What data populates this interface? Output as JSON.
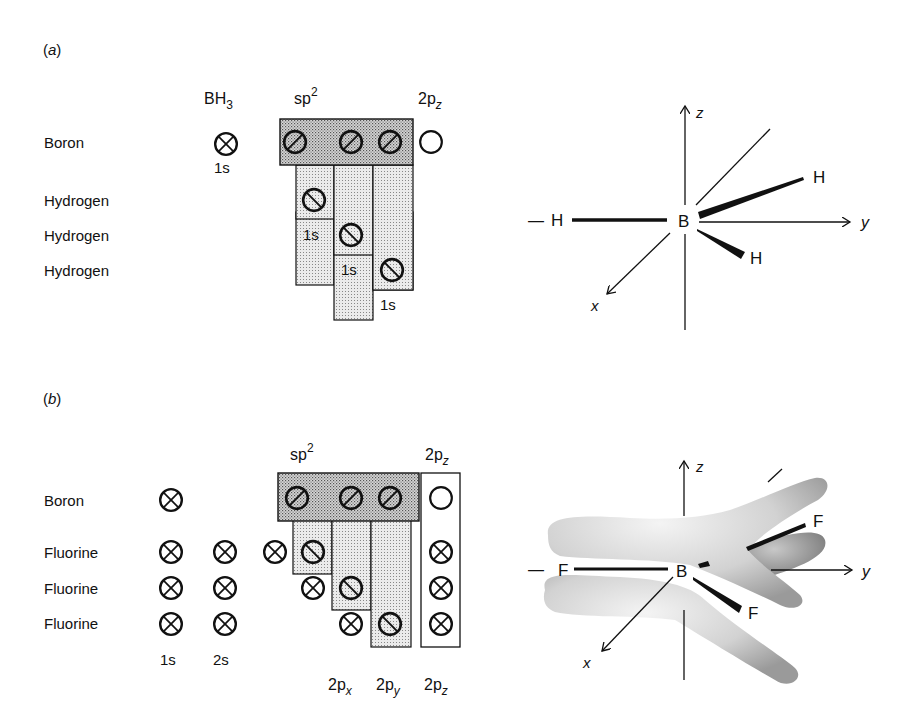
{
  "panel_a": {
    "label": "(a)",
    "headers": {
      "bh3": "BH",
      "bh3_sub": "3",
      "sp2": "sp",
      "sp2_sup": "2",
      "p2z": "2p",
      "p2z_sub": "z"
    },
    "rows": [
      "Boron",
      "Hydrogen",
      "Hydrogen",
      "Hydrogen"
    ],
    "orbital_labels": {
      "boron_1s": "1s",
      "h1": "1s",
      "h2": "1s",
      "h3": "1s"
    },
    "molecule": {
      "atoms": {
        "center": "B",
        "left": "H",
        "upper_right": "H",
        "lower_right": "H",
        "far_left_dash": "—"
      },
      "axes": {
        "x": "x",
        "y": "y",
        "z": "z"
      }
    }
  },
  "panel_b": {
    "label": "(b)",
    "headers": {
      "sp2": "sp",
      "sp2_sup": "2",
      "p2z": "2p",
      "p2z_sub": "z"
    },
    "rows": [
      "Boron",
      "Fluorine",
      "Fluorine",
      "Fluorine"
    ],
    "column_labels": {
      "s1": "1s",
      "s2": "2s",
      "px": "2p",
      "px_sub": "x",
      "py": "2p",
      "py_sub": "y",
      "pz": "2p",
      "pz_sub": "z"
    },
    "molecule": {
      "atoms": {
        "center": "B",
        "left": "F",
        "upper_right": "F",
        "lower_right": "F",
        "far_left_dash": "—"
      },
      "axes": {
        "x": "x",
        "y": "y",
        "z": "z"
      }
    }
  },
  "colors": {
    "ink": "#111111",
    "stipple_dark": "#bdbdbd",
    "stipple_light": "#d9d9d9",
    "lobe": "#cfcfcf"
  }
}
